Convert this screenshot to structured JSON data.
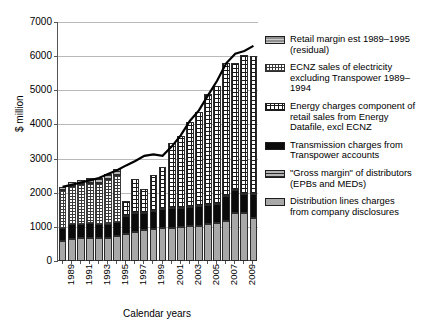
{
  "chart_data": {
    "type": "bar",
    "subtype": "stacked-bar-with-total-line",
    "title": "",
    "xlabel": "Calendar years",
    "ylabel": "$ million",
    "ylim": [
      0,
      7000
    ],
    "ytick_values": [
      0,
      1000,
      2000,
      3000,
      4000,
      5000,
      6000,
      7000
    ],
    "ytick_labels": [
      "0",
      "1000",
      "2000",
      "3000",
      "4000",
      "5000",
      "6000",
      "7000"
    ],
    "grid": true,
    "legend_position": "right",
    "categories": [
      1989,
      1990,
      1991,
      1992,
      1993,
      1994,
      1995,
      1996,
      1997,
      1998,
      1999,
      2000,
      2001,
      2002,
      2003,
      2004,
      2005,
      2006,
      2007,
      2008,
      2009,
      2010
    ],
    "xtick_labels": [
      "1989",
      "1990",
      "1991",
      "1992",
      "1993",
      "1994",
      "1995",
      "1996",
      "1997",
      "1998",
      "1999",
      "2000",
      "2001",
      "2002",
      "2003",
      "2004",
      "2005",
      "2006",
      "2007",
      "2008",
      "2009",
      "2010"
    ],
    "xtick_labels_shown": [
      "1989",
      "1991",
      "1993",
      "1995",
      "1997",
      "1999",
      "2001",
      "2003",
      "2005",
      "2007",
      "2009"
    ],
    "series": [
      {
        "name": "Distribution lines charges from company disclosures",
        "pattern": "solid-light-grey",
        "color": "#a8a8a8",
        "values": [
          600,
          640,
          660,
          680,
          670,
          680,
          720,
          800,
          860,
          900,
          930,
          960,
          980,
          1000,
          1020,
          1040,
          1080,
          1100,
          1180,
          1420,
          1400,
          1250
        ]
      },
      {
        "name": "\"Gross margin\" of distributors (EPBs and MEDs)",
        "pattern": "grey-horizontal-lines",
        "color": "#8f8f8f",
        "values": [
          0,
          0,
          0,
          0,
          0,
          0,
          0,
          0,
          0,
          0,
          0,
          0,
          0,
          0,
          0,
          0,
          0,
          0,
          0,
          0,
          0,
          0
        ]
      },
      {
        "name": "Transmission charges from Transpower accounts",
        "pattern": "solid-black",
        "color": "#0b0b0b",
        "values": [
          380,
          450,
          420,
          420,
          420,
          410,
          420,
          520,
          540,
          520,
          530,
          560,
          570,
          560,
          560,
          560,
          560,
          570,
          710,
          650,
          560,
          700
        ]
      },
      {
        "name": "Energy charges component of retail sales from Energy Datafile, excl ECNZ",
        "pattern": "black-grid-crosshatch-on-white",
        "color": "#ffffff",
        "values": [
          0,
          0,
          0,
          0,
          0,
          0,
          0,
          430,
          1010,
          700,
          1070,
          1230,
          1900,
          2100,
          2500,
          2750,
          3260,
          3450,
          3910,
          3730,
          4060,
          4060
        ]
      },
      {
        "name": "ECNZ sales of electricity excluding Transpower 1989–1994",
        "pattern": "fine-grey-stipple",
        "color": "#d8d8d8",
        "values": [
          1060,
          1090,
          1140,
          1170,
          1180,
          1270,
          1360,
          0,
          0,
          0,
          0,
          0,
          0,
          0,
          0,
          0,
          0,
          0,
          0,
          0,
          0,
          0
        ]
      },
      {
        "name": "Retail margin est 1989–1995 (residual)",
        "pattern": "grey-horizontal-lines",
        "color": "#9c9c9c",
        "values": [
          130,
          140,
          150,
          150,
          160,
          200,
          210,
          0,
          0,
          0,
          0,
          0,
          0,
          0,
          0,
          0,
          0,
          0,
          0,
          0,
          0,
          0
        ]
      }
    ],
    "total_line": {
      "name": "Total",
      "values": [
        2170,
        2230,
        2300,
        2360,
        2430,
        2550,
        2660,
        2800,
        2930,
        3080,
        3120,
        3080,
        3350,
        3680,
        4100,
        4410,
        4850,
        5280,
        5790,
        6070,
        6150,
        6300
      ]
    }
  },
  "axes": {
    "y_title": "$ million",
    "x_title": "Calendar years"
  },
  "legend": {
    "items": [
      {
        "swatch": "grey-horizontal-lines",
        "label": "Retail margin est 1989–1995\n(residual)"
      },
      {
        "swatch": "fine-grey-stipple",
        "label": "ECNZ sales of electricity\nexcluding Transpower 1989–\n1994"
      },
      {
        "swatch": "black-grid-crosshatch-on-white",
        "label": "Energy charges component of\nretail sales from Energy\nDatafile, excl ECNZ"
      },
      {
        "swatch": "solid-black",
        "label": "Transmission charges from\nTranspower accounts"
      },
      {
        "swatch": "grey-horizontal-lines-2",
        "label": "\"Gross margin\" of distributors\n(EPBs and MEDs)"
      },
      {
        "swatch": "solid-light-grey",
        "label": "Distribution lines charges\nfrom company disclosures"
      }
    ]
  }
}
